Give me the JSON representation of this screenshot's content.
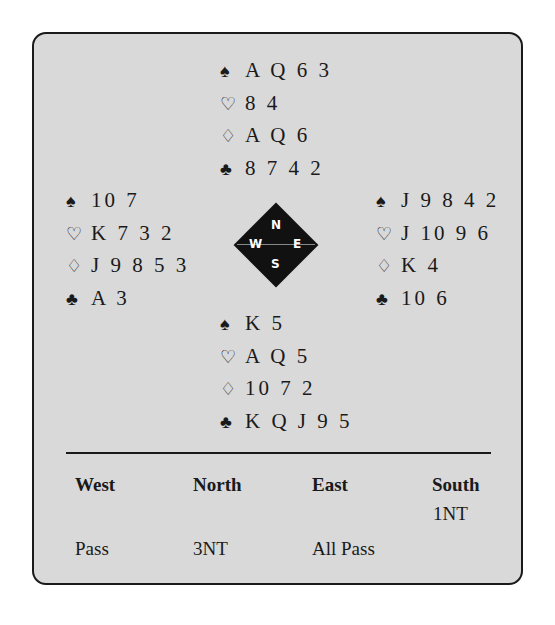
{
  "deal": {
    "north": {
      "spades": "AQ63",
      "hearts": "84",
      "diamonds": "AQ6",
      "clubs": "8742"
    },
    "west": {
      "spades": "107",
      "hearts": "K732",
      "diamonds": "J9853",
      "clubs": "A3"
    },
    "east": {
      "spades": "J9842",
      "hearts": "J1096",
      "diamonds": "K4",
      "clubs": "106"
    },
    "south": {
      "spades": "K5",
      "hearts": "AQ5",
      "diamonds": "1072",
      "clubs": "KQJ95"
    }
  },
  "display": {
    "north": [
      "A Q 6 3",
      "8 4",
      "A Q 6",
      "8 7 4 2"
    ],
    "west": [
      "10 7",
      "K 7 3 2",
      "J 9 8 5 3",
      "A 3"
    ],
    "east": [
      "J 9 8 4 2",
      "J 10 9 6",
      "K 4",
      "10 6"
    ],
    "south": [
      "K 5",
      "A Q 5",
      "10 7 2",
      "K Q J 9 5"
    ]
  },
  "suit_icons": {
    "spades": "♠",
    "hearts": "♡",
    "diamonds": "♢",
    "clubs": "♣"
  },
  "compass": {
    "n": "N",
    "s": "S",
    "w": "W",
    "e": "E"
  },
  "auction": {
    "headers": [
      "West",
      "North",
      "East",
      "South"
    ],
    "rows": [
      [
        "",
        "",
        "",
        "1NT"
      ],
      [
        "Pass",
        "3NT",
        "All Pass",
        ""
      ]
    ]
  },
  "colors": {
    "panel_bg": "#d9d9d9",
    "ink": "#1a1a1a"
  }
}
